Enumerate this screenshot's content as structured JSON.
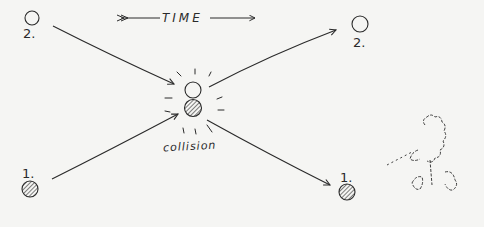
{
  "diagram": {
    "type": "hand-drawn sketch",
    "title": "TIME",
    "time_arrow_direction": "left-to-right",
    "collision_label": "collision",
    "colors": {
      "ink": "#2a2a2a",
      "paper": "#f5f5f3"
    },
    "particles": {
      "before": [
        {
          "label": "2.",
          "fill": "hollow",
          "position": "top-left"
        },
        {
          "label": "1.",
          "fill": "hatched",
          "position": "bottom-left"
        }
      ],
      "at_collision": [
        {
          "fill": "hollow",
          "position": "center-top"
        },
        {
          "fill": "hatched",
          "position": "center-bottom"
        }
      ],
      "after": [
        {
          "label": "2.",
          "fill": "hollow",
          "position": "top-right"
        },
        {
          "label": "1.",
          "fill": "hatched",
          "position": "bottom-right"
        }
      ]
    },
    "trajectories": [
      {
        "from": "2. top-left",
        "to": "collision"
      },
      {
        "from": "1. bottom-left",
        "to": "collision"
      },
      {
        "from": "collision",
        "to": "2. top-right"
      },
      {
        "from": "collision",
        "to": "1. bottom-right"
      }
    ],
    "extra_sketch": "tree / shrub with dotted line of sight"
  }
}
